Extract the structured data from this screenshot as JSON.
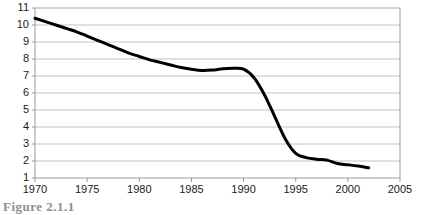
{
  "chart_data": {
    "type": "line",
    "title": "",
    "subtitle": "",
    "xlabel": "",
    "ylabel": "",
    "xlim": [
      1970,
      2005
    ],
    "ylim": [
      1,
      11
    ],
    "grid": "horizontal",
    "legend": "none",
    "x_ticks": [
      1970,
      1975,
      1980,
      1985,
      1990,
      1995,
      2000,
      2005
    ],
    "y_ticks": [
      1,
      2,
      3,
      4,
      5,
      6,
      7,
      8,
      9,
      10,
      11
    ],
    "series": [
      {
        "name": "series-1",
        "color": "#000000",
        "line_width": 3,
        "x": [
          1970,
          1971,
          1972,
          1973,
          1974,
          1975,
          1976,
          1977,
          1978,
          1979,
          1980,
          1981,
          1982,
          1983,
          1984,
          1985,
          1986,
          1987,
          1988,
          1989,
          1990,
          1991,
          1992,
          1993,
          1994,
          1995,
          1996,
          1997,
          1998,
          1999,
          2000,
          2001,
          2002
        ],
        "values": [
          10.4,
          10.2,
          10.0,
          9.8,
          9.6,
          9.35,
          9.1,
          8.85,
          8.6,
          8.35,
          8.15,
          7.95,
          7.8,
          7.65,
          7.5,
          7.4,
          7.33,
          7.35,
          7.42,
          7.45,
          7.4,
          6.9,
          5.9,
          4.6,
          3.3,
          2.45,
          2.2,
          2.1,
          2.05,
          1.85,
          1.78,
          1.7,
          1.6
        ]
      }
    ]
  },
  "axes": {
    "y_tick_labels": [
      "11",
      "10",
      "9",
      "8",
      "7",
      "6",
      "5",
      "4",
      "3",
      "2",
      "1"
    ],
    "x_tick_labels": [
      "1970",
      "1975",
      "1980",
      "1985",
      "1990",
      "1995",
      "2000",
      "2005"
    ]
  },
  "caption": {
    "fragment": "Figure 2.1.1"
  },
  "colors": {
    "line": "#000000",
    "gridline": "#c3c3c3",
    "axis": "#9a9a9a",
    "background": "#ffffff",
    "text": "#1a1a1a"
  }
}
